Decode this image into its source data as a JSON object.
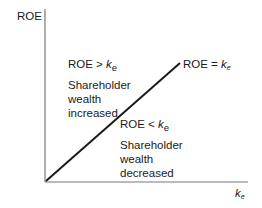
{
  "diagram": {
    "y_axis_label": "ROE",
    "x_axis_label": {
      "base": "k",
      "sub": "e"
    },
    "line_label": {
      "prefix": "ROE = ",
      "base": "k",
      "sub": "e"
    },
    "region_above": {
      "condition": {
        "prefix": "ROE > ",
        "base": "k",
        "sub": "e"
      },
      "lines": [
        "Shareholder",
        "wealth",
        "increased"
      ]
    },
    "region_below": {
      "condition": {
        "prefix": "ROE < ",
        "base": "k",
        "sub": "e"
      },
      "lines": [
        "Shareholder",
        "wealth",
        "decreased"
      ]
    },
    "colors": {
      "axis": "#777777",
      "line": "#1a1a1a",
      "text": "#1a1a1a"
    }
  }
}
